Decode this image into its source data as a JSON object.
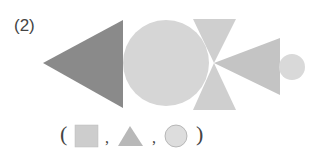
{
  "problem": {
    "number_label": "(2)",
    "figure_description": "Composite figure made of triangles and circles",
    "colors": {
      "dark_triangle": "#8a8a8a",
      "light_fill": "#cfcfcf",
      "circle_fill": "#d6d6d6",
      "square_fill": "#cdcdcd",
      "triangle_option_fill": "#b8b8b8",
      "circle_option_fill": "#dddddd",
      "circle_option_stroke": "#aaaaaa"
    }
  },
  "answer_row": {
    "open_paren": "(",
    "close_paren": ")",
    "separator": ",",
    "options": [
      {
        "shape": "square-icon"
      },
      {
        "shape": "triangle-icon"
      },
      {
        "shape": "circle-icon"
      }
    ]
  }
}
